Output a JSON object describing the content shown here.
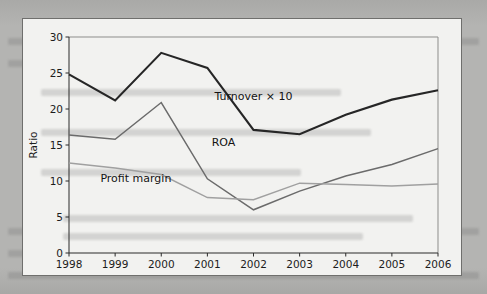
{
  "figure": {
    "background_color": "#b3b3b1",
    "panel_color": "#f2f2f0",
    "panel_border_color": "#6f6f6d"
  },
  "chart_data": {
    "type": "line",
    "title": "",
    "subtitle": "",
    "xlabel": "",
    "ylabel": "Ratio",
    "categories": [
      "1998",
      "1999",
      "2000",
      "2001",
      "2002",
      "2003",
      "2004",
      "2005",
      "2006"
    ],
    "x": [
      1998,
      1999,
      2000,
      2001,
      2002,
      2003,
      2004,
      2005,
      2006
    ],
    "xlim": [
      1998,
      2006
    ],
    "ylim": [
      0,
      30
    ],
    "y_ticks": [
      0,
      5,
      10,
      15,
      20,
      25,
      30
    ],
    "x_ticks": [
      1998,
      1999,
      2000,
      2001,
      2002,
      2003,
      2004,
      2005,
      2006
    ],
    "grid": false,
    "legend": "inline-annotations",
    "series": [
      {
        "name": "Turnover × 10",
        "color": "#262626",
        "width": 2.1,
        "values": [
          24.8,
          21.2,
          27.8,
          25.7,
          17.1,
          16.5,
          19.2,
          21.3,
          22.6
        ]
      },
      {
        "name": "ROA",
        "color": "#6b6b6b",
        "width": 1.5,
        "values": [
          16.4,
          15.8,
          20.9,
          10.3,
          6.0,
          8.6,
          10.7,
          12.3,
          14.5
        ]
      },
      {
        "name": "Profit margin",
        "color": "#a0a0a0",
        "width": 1.5,
        "values": [
          12.5,
          11.8,
          10.9,
          7.7,
          7.4,
          9.7,
          9.5,
          9.3,
          9.6
        ]
      }
    ],
    "annotations": [
      {
        "text": "Turnover × 10",
        "x": 2002,
        "y": 21.3,
        "anchor": "middle"
      },
      {
        "text": "ROA",
        "x": 2001.35,
        "y": 14.9,
        "anchor": "middle"
      },
      {
        "text": "Profit margin",
        "x": 1999.45,
        "y": 9.9,
        "anchor": "middle"
      }
    ]
  }
}
